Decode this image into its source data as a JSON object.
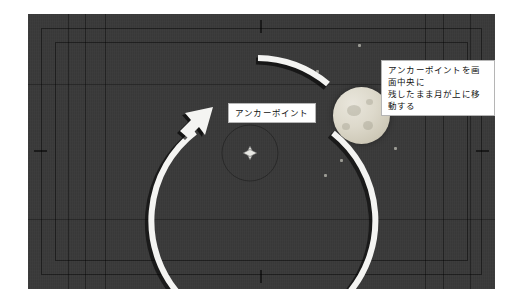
{
  "figure": {
    "kind": "after-effects-viewport-illustration",
    "background_color": "#ffffff"
  },
  "viewport": {
    "name": "composition-viewport",
    "background_color": "#3a3a3a",
    "frames": [
      {
        "name": "outer-guide-frame"
      },
      {
        "name": "inner-guide-frame"
      }
    ]
  },
  "anchor_point": {
    "marker_icon": "anchor-point-diamond-icon",
    "orbit_guide_visible": true
  },
  "moon": {
    "name": "moon-layer",
    "fill_color": "#ddd9cb",
    "shadow_color": "#bdb8a6"
  },
  "motion": {
    "arc_color": "#f2f2f2",
    "arrow_direction": "counter-clockwise-up",
    "arrow_icon": "curved-arrow-icon"
  },
  "callouts": [
    {
      "id": "anchor-point-callout",
      "text": "アンカーポイント"
    },
    {
      "id": "moon-motion-callout",
      "text": "アンカーポイントを画面中央に\n残したまま月が上に移動する"
    }
  ]
}
